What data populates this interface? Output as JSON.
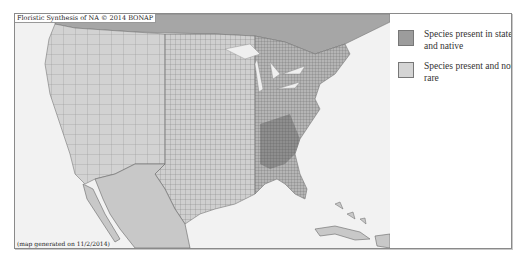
{
  "map": {
    "title": "Floristic Synthesis of NA © 2014 BONAP",
    "footer": "(map generated on 11/2/2014)",
    "colors": {
      "ocean": "#f2f2f2",
      "land_not_rare": "#cfcfcf",
      "land_native": "#9a9a9a",
      "county_lines": "#6e6e6e",
      "canada": "#a8a8a8",
      "lakes": "#f0f0f0"
    }
  },
  "legend": {
    "items": [
      {
        "label": "Species present in state and native",
        "color": "#9c9c9c"
      },
      {
        "label": "Species present and not rare",
        "color": "#d4d4d4"
      }
    ]
  }
}
